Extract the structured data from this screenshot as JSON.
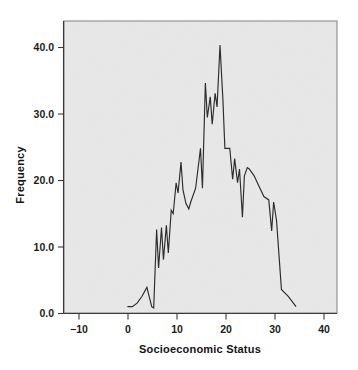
{
  "chart_data": {
    "type": "line",
    "title": "",
    "subtitle": "",
    "xlabel": "Socioeconomic Status",
    "ylabel": "Frequency",
    "xlim": [
      -13,
      43
    ],
    "ylim": [
      0,
      42.5
    ],
    "xticks": [
      -10,
      0,
      10,
      20,
      30,
      40
    ],
    "xtick_labels": [
      "−10",
      "0",
      "10",
      "20",
      "30",
      "40"
    ],
    "yticks": [
      0,
      10,
      20,
      30,
      40
    ],
    "ytick_labels": [
      "0.0",
      "10.0",
      "20.0",
      "30.0",
      "40.0"
    ],
    "grid": false,
    "legend": null,
    "annotations": [],
    "series": [
      {
        "name": "Frequency",
        "color": "#2b2b2b",
        "x": [
          0,
          1,
          2,
          3,
          4,
          5,
          5.4,
          6,
          6.4,
          7,
          7.4,
          8,
          8.4,
          9,
          9.4,
          10,
          10.4,
          11,
          11.4,
          12,
          12.6,
          13,
          14,
          15,
          15.4,
          16,
          16.4,
          17,
          17.4,
          18,
          18.4,
          19,
          19.6,
          20,
          21,
          21.6,
          22,
          22.6,
          23,
          23.6,
          24,
          24.6,
          25,
          26,
          27,
          28,
          29,
          29.6,
          30,
          30.6,
          31.6,
          33,
          34.6
        ],
        "y": [
          1,
          1,
          1.5,
          2.5,
          3.8,
          1,
          0.8,
          12.2,
          6.6,
          12.5,
          7.8,
          12.8,
          8.8,
          15,
          14.5,
          19,
          17.5,
          22,
          18,
          16,
          15.2,
          16.2,
          18.2,
          24,
          18.2,
          33.5,
          28.5,
          31.5,
          27.5,
          32,
          30,
          39,
          31,
          24,
          24,
          19.5,
          22.5,
          19,
          21,
          14,
          20,
          21.2,
          21,
          20,
          18.5,
          17,
          16.5,
          12,
          16.2,
          13.5,
          3.5,
          2.5,
          1
        ]
      }
    ]
  },
  "figure": {
    "background_color": "#ffffff",
    "plot_background_color": "#e8e8e8",
    "frame_color": "#8a8a8a",
    "line_color": "#2b2b2b",
    "text_color": "#1b1b1b"
  }
}
